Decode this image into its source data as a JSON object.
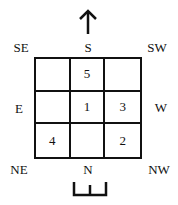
{
  "diagram": {
    "arrow": {
      "direction": "up",
      "icon": "arrow-up-icon"
    },
    "directions": {
      "top_left": "SE",
      "top": "S",
      "top_right": "SW",
      "left": "E",
      "right": "W",
      "bottom_left": "NE",
      "bottom": "N",
      "bottom_right": "NW"
    },
    "grid": {
      "rows": [
        [
          "",
          "5",
          ""
        ],
        [
          "",
          "1",
          "3"
        ],
        [
          "4",
          "",
          "2"
        ]
      ]
    },
    "gate_symbol": {
      "icon": "gate-icon"
    }
  }
}
